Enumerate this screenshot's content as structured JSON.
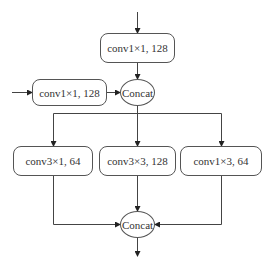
{
  "diagram": {
    "nodes": {
      "top_conv": {
        "label": "conv1×1, 128"
      },
      "side_conv": {
        "label": "conv1×1, 128"
      },
      "concat_1": {
        "label": "Concat"
      },
      "branch_left": {
        "label": "conv3×1, 64"
      },
      "branch_middle": {
        "label": "conv3×3, 128"
      },
      "branch_right": {
        "label": "conv1×3, 64"
      },
      "concat_2": {
        "label": "Concat"
      }
    },
    "edges": [
      {
        "from": "input_top",
        "to": "top_conv"
      },
      {
        "from": "input_side",
        "to": "side_conv"
      },
      {
        "from": "top_conv",
        "to": "concat_1"
      },
      {
        "from": "side_conv",
        "to": "concat_1"
      },
      {
        "from": "concat_1",
        "to": "branch_left"
      },
      {
        "from": "concat_1",
        "to": "branch_middle"
      },
      {
        "from": "concat_1",
        "to": "branch_right"
      },
      {
        "from": "branch_left",
        "to": "concat_2"
      },
      {
        "from": "branch_middle",
        "to": "concat_2"
      },
      {
        "from": "branch_right",
        "to": "concat_2"
      },
      {
        "from": "concat_2",
        "to": "output"
      }
    ],
    "colors": {
      "stroke": "#555555",
      "text": "#333333",
      "background": "#ffffff"
    }
  }
}
